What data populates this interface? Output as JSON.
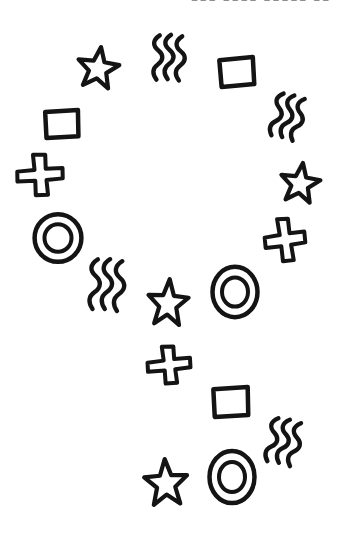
{
  "page": {
    "paper_color": "#ffffff",
    "ink_color": "#141414",
    "header_text_color": "#8e8e8e"
  },
  "header": {
    "cropped_text": "▪▪▪ ▪▪▪▪ ▪▪▪▪▪ ▪▪"
  },
  "shapes": [
    {
      "type": "star",
      "cx": 98,
      "cy": 69,
      "w": 46,
      "h": 47,
      "rot": 8
    },
    {
      "type": "squiggle",
      "cx": 168,
      "cy": 57,
      "w": 33,
      "h": 47,
      "rot": 0
    },
    {
      "type": "square",
      "cx": 237,
      "cy": 72,
      "w": 42,
      "h": 34,
      "rot": -4
    },
    {
      "type": "square",
      "cx": 62,
      "cy": 124,
      "w": 41,
      "h": 33,
      "rot": -2
    },
    {
      "type": "squiggle",
      "cx": 287,
      "cy": 116,
      "w": 32,
      "h": 46,
      "rot": 12
    },
    {
      "type": "plus",
      "cx": 40,
      "cy": 175,
      "w": 51,
      "h": 45,
      "rot": -4
    },
    {
      "type": "star",
      "cx": 300,
      "cy": 184,
      "w": 44,
      "h": 45,
      "rot": 8
    },
    {
      "type": "double-circle",
      "cx": 58,
      "cy": 238,
      "w": 52,
      "h": 53,
      "rot": 0
    },
    {
      "type": "plus",
      "cx": 285,
      "cy": 240,
      "w": 45,
      "h": 47,
      "rot": -8
    },
    {
      "type": "squiggle",
      "cx": 106,
      "cy": 284,
      "w": 36,
      "h": 53,
      "rot": 2
    },
    {
      "type": "double-circle",
      "cx": 235,
      "cy": 292,
      "w": 50,
      "h": 56,
      "rot": 0
    },
    {
      "type": "star",
      "cx": 168,
      "cy": 304,
      "w": 45,
      "h": 53,
      "rot": 4
    },
    {
      "type": "plus",
      "cx": 169,
      "cy": 365,
      "w": 48,
      "h": 41,
      "rot": -6
    },
    {
      "type": "square",
      "cx": 231,
      "cy": 402,
      "w": 43,
      "h": 35,
      "rot": -2
    },
    {
      "type": "squiggle",
      "cx": 283,
      "cy": 441,
      "w": 34,
      "h": 47,
      "rot": 10
    },
    {
      "type": "star",
      "cx": 166,
      "cy": 484,
      "w": 48,
      "h": 53,
      "rot": -3
    },
    {
      "type": "double-circle",
      "cx": 232,
      "cy": 477,
      "w": 50,
      "h": 58,
      "rot": 0
    }
  ]
}
